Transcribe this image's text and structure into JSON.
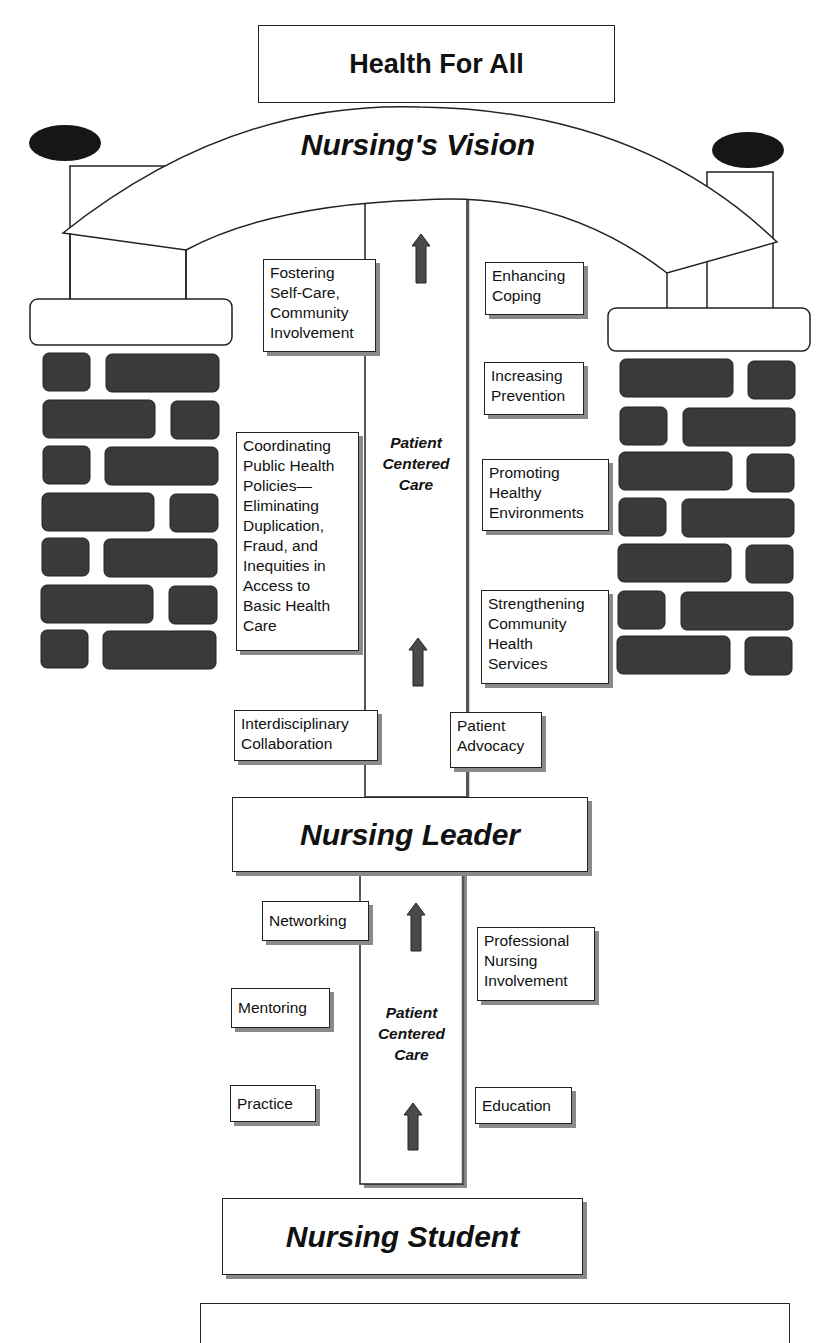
{
  "diagram": {
    "top_title": "Health For All",
    "arch_label": "Nursing's Vision",
    "upper_column_label": [
      "Patient",
      "Centered",
      "Care"
    ],
    "lower_column_label": [
      "Patient",
      "Centered",
      "Care"
    ],
    "middle_title": "Nursing Leader",
    "bottom_title": "Nursing Student",
    "upper_left_boxes": [
      {
        "lines": [
          "Fostering",
          "Self-Care,",
          "Community",
          "Involvement"
        ]
      },
      {
        "lines": [
          "Coordinating",
          "Public Health",
          "Policies—",
          "Eliminating",
          "Duplication,",
          "Fraud, and",
          "Inequities in",
          "Access to",
          "Basic Health",
          "Care"
        ]
      },
      {
        "lines": [
          "Interdisciplinary",
          "Collaboration"
        ]
      }
    ],
    "upper_right_boxes": [
      {
        "lines": [
          "Enhancing",
          "Coping"
        ]
      },
      {
        "lines": [
          "Increasing",
          "Prevention"
        ]
      },
      {
        "lines": [
          "Promoting",
          "Healthy",
          "Environments"
        ]
      },
      {
        "lines": [
          "Strengthening",
          "Community",
          "Health",
          "Services"
        ]
      },
      {
        "lines": [
          "Patient",
          "Advocacy"
        ]
      }
    ],
    "lower_left_boxes": [
      {
        "lines": [
          "Networking"
        ]
      },
      {
        "lines": [
          "Mentoring"
        ]
      },
      {
        "lines": [
          "Practice"
        ]
      }
    ],
    "lower_right_boxes": [
      {
        "lines": [
          "Professional",
          "Nursing",
          "Involvement"
        ]
      },
      {
        "lines": [
          "Education"
        ]
      }
    ],
    "icons": {
      "arrow": "up-arrow-icon",
      "pillar_top": "ellipse-finial-icon",
      "brick": "brick-icon"
    },
    "colors": {
      "brick_fill": "#3a3a3a",
      "arrow_fill": "#4a4a4a",
      "line": "#222222",
      "shadow": "#8a8a8a"
    }
  }
}
